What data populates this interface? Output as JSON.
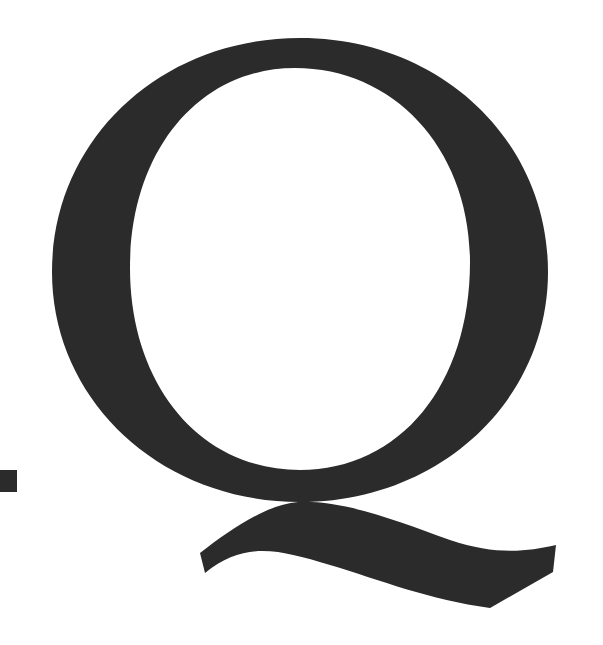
{
  "glyph": {
    "character": "Q",
    "ink_color": "#2b2b2b",
    "background_color": "#ffffff"
  },
  "fragment": {
    "description": "partial glyph at left edge",
    "ink_color": "#2b2b2b"
  }
}
